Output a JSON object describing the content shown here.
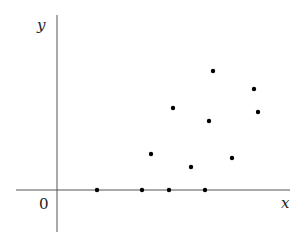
{
  "chart_data": {
    "type": "scatter",
    "title": "",
    "xlabel": "x",
    "ylabel": "y",
    "origin_label": "0",
    "grid": false,
    "legend": null,
    "ticks": false,
    "xlim": [
      -4.1,
      23.3
    ],
    "ylim": [
      -4.2,
      17.5
    ],
    "points": [
      {
        "x": 4.0,
        "y": 0.0
      },
      {
        "x": 8.5,
        "y": 0.0
      },
      {
        "x": 11.2,
        "y": 0.0
      },
      {
        "x": 14.8,
        "y": 0.0
      },
      {
        "x": 9.4,
        "y": 3.6
      },
      {
        "x": 13.4,
        "y": 2.3
      },
      {
        "x": 17.5,
        "y": 3.2
      },
      {
        "x": 11.6,
        "y": 8.2
      },
      {
        "x": 15.2,
        "y": 6.9
      },
      {
        "x": 15.6,
        "y": 11.9
      },
      {
        "x": 19.7,
        "y": 10.1
      },
      {
        "x": 20.1,
        "y": 7.8
      }
    ],
    "marker_color": "#000000",
    "axis_color": "#555555"
  }
}
